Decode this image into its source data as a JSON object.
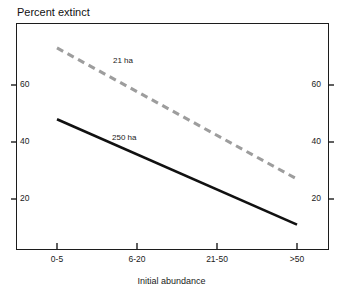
{
  "chart_data": {
    "type": "line",
    "title": "Percent extinct",
    "xlabel": "Initial abundance",
    "ylabel": "Percent extinct",
    "categories": [
      "0-5",
      "6-20",
      "21-50",
      ">50"
    ],
    "ylim": [
      0,
      80
    ],
    "yticks": [
      20,
      40,
      60
    ],
    "ytick_labels": [
      "20",
      "40",
      "60"
    ],
    "grid": false,
    "legend": "inline-labels",
    "series": [
      {
        "name": "21 ha",
        "label": "21 ha",
        "style": "dashed",
        "color": "#9d9d9d",
        "values": [
          73,
          57.5,
          42,
          27
        ]
      },
      {
        "name": "250 ha",
        "label": "250 ha",
        "style": "solid",
        "color": "#111111",
        "values": [
          48,
          35.7,
          23.3,
          11
        ]
      }
    ],
    "axes": {
      "left_ticks": [
        "60",
        "40",
        "20"
      ],
      "right_ticks": [
        "60",
        "40",
        "20"
      ],
      "tick_direction": "inward"
    }
  },
  "colors": {
    "frame": "#1c1c1c",
    "solid_series": "#111111",
    "dashed_series": "#9d9d9d",
    "background": "#ffffff",
    "text": "#1a1a1a"
  }
}
